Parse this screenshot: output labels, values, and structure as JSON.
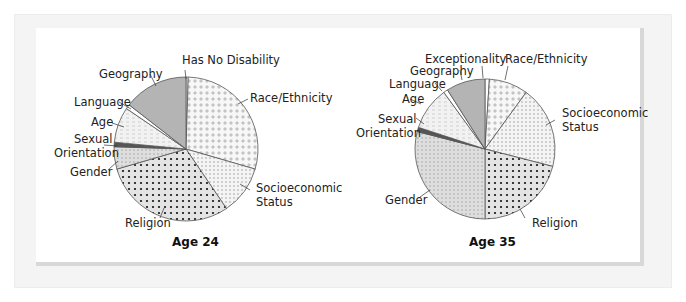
{
  "chart_data": [
    {
      "type": "pie",
      "title": "Age 24",
      "categories": [
        "Has No Disability",
        "Race/Ethnicity",
        "Socioeconomic Status",
        "Religion",
        "Gender",
        "Sexual Orientation",
        "Age",
        "Language",
        "Geography"
      ],
      "values": [
        0.5,
        29,
        11,
        30,
        5,
        1,
        8,
        1,
        14.5
      ],
      "start_angle": "12 o'clock, clockwise",
      "patterns": [
        "white",
        "light-diamond",
        "light-dots",
        "heavy-dots",
        "grid-dots",
        "dark-solid",
        "dashes",
        "white",
        "gray-solid"
      ]
    },
    {
      "type": "pie",
      "title": "Age 35",
      "categories": [
        "Exceptionality",
        "Race/Ethnicity",
        "Socioeconomic Status",
        "Religion",
        "Gender",
        "Sexual Orientation",
        "Age",
        "Language",
        "Geography"
      ],
      "values": [
        1,
        9,
        19,
        21,
        29,
        1,
        10,
        1,
        9
      ],
      "start_angle": "12 o'clock, clockwise",
      "patterns": [
        "white",
        "light-diamond",
        "light-dots",
        "heavy-dots",
        "grid-dots",
        "dark-solid",
        "dashes",
        "white",
        "gray-solid"
      ]
    }
  ],
  "charts": {
    "left": {
      "title": "Age 24",
      "labels": {
        "has_no_disability": "Has No Disability",
        "race": "Race/Ethnicity",
        "socio1": "Socioeconomic",
        "socio2": "Status",
        "religion": "Religion",
        "gender": "Gender",
        "sexual1": "Sexual",
        "sexual2": "Orientation",
        "age": "Age",
        "language": "Language",
        "geography": "Geography"
      }
    },
    "right": {
      "title": "Age 35",
      "labels": {
        "exceptionality": "Exceptionality",
        "race": "Race/Ethnicity",
        "socio1": "Socioeconomic",
        "socio2": "Status",
        "religion": "Religion",
        "gender": "Gender",
        "sexual1": "Sexual",
        "sexual2": "Orientation",
        "age": "Age",
        "language": "Language",
        "geography": "Geography"
      }
    }
  },
  "colors": {
    "geography": "#b4b4b4",
    "sexual_orientation": "#555555",
    "outline": "#555555",
    "panel_bg": "#f4f4f4"
  }
}
